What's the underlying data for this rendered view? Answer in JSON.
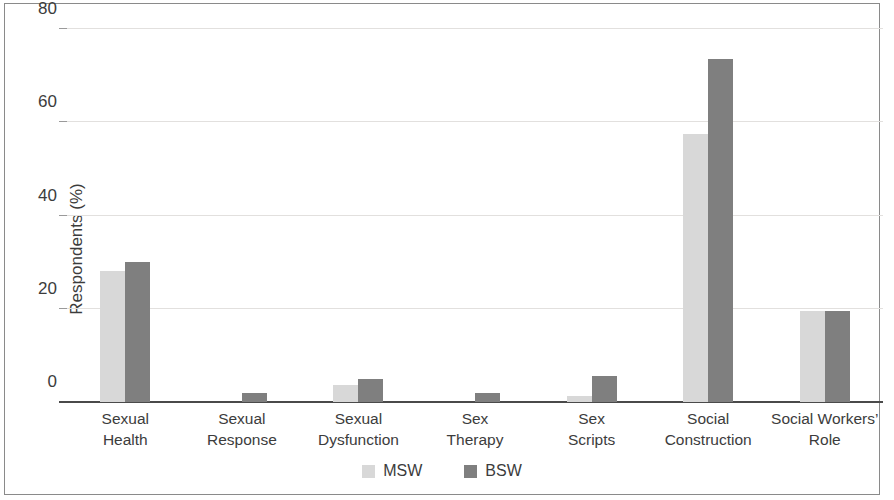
{
  "chart_data": {
    "type": "bar",
    "title": "",
    "xlabel": "",
    "ylabel": "Respondents (%)",
    "ylim": [
      0,
      80
    ],
    "yticks": [
      0,
      20,
      40,
      60,
      80
    ],
    "ytick_labels": [
      "0",
      "20",
      "40",
      "60",
      "80"
    ],
    "grid": true,
    "legend_position": "bottom-center",
    "categories": [
      "Sexual Health",
      "Sexual Response",
      "Sexual Dysfunction",
      "Sex Therapy",
      "Sex Scripts",
      "Social Construction",
      "Social Workers’ Role"
    ],
    "category_lines": [
      [
        "Sexual",
        "Health"
      ],
      [
        "Sexual",
        "Response"
      ],
      [
        "Sexual",
        "Dysfunction"
      ],
      [
        "Sex",
        "Therapy"
      ],
      [
        "Sex",
        "Scripts"
      ],
      [
        "Social",
        "Construction"
      ],
      [
        "Social Workers’",
        "Role"
      ]
    ],
    "series": [
      {
        "name": "MSW",
        "color": "#d8d8d8",
        "values": [
          28,
          0,
          3.7,
          0,
          1.3,
          57.5,
          19.5
        ]
      },
      {
        "name": "BSW",
        "color": "#7f7f7f",
        "values": [
          30,
          2,
          5,
          2,
          5.5,
          73.5,
          19.5
        ]
      }
    ]
  },
  "legend": {
    "items": [
      {
        "label": "MSW",
        "color": "#d8d8d8"
      },
      {
        "label": "BSW",
        "color": "#7f7f7f"
      }
    ]
  }
}
